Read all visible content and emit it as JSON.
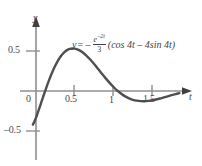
{
  "figure": {
    "background_color": "#ffffff",
    "curve_color": "#4f4f4f",
    "axis_color": "#8c8c8c",
    "text_color": "#4a4a4a"
  },
  "axes": {
    "y_axis_label": "y",
    "x_axis_label": "t",
    "x_tick_labels": [
      "0",
      "0.5",
      "1",
      "1.5"
    ],
    "y_tick_labels": [
      "0.5",
      "–0.5"
    ],
    "origin_label": "0"
  },
  "equation": {
    "lhs": "y",
    "equals": "= –",
    "numerator": "e",
    "numerator_exponent": "–2t",
    "denominator": "3",
    "tail": "(cos 4t – 4sin 4t)",
    "plain": "y = – e^(–2t)/3 (cos 4t – 4sin 4t)"
  },
  "chart_data": {
    "type": "line",
    "title": "",
    "xlabel": "t",
    "ylabel": "y",
    "xlim": [
      -0.05,
      1.88
    ],
    "ylim": [
      -0.62,
      0.82
    ],
    "xticks": [
      0,
      0.5,
      1,
      1.5
    ],
    "xticklabels": [
      "0",
      "0.5",
      "1",
      "1.5"
    ],
    "yticks": [
      -0.5,
      0.5
    ],
    "yticklabels": [
      "–0.5",
      "0.5"
    ],
    "grid": false,
    "legend": null,
    "annotations": [
      {
        "text": "y = – e^(–2t)/3 (cos 4t – 4sin 4t)",
        "x": 0.5,
        "y": 0.55
      }
    ],
    "series": [
      {
        "name": "y(t) = -(e^(-2t)/3)(cos 4t - 4 sin 4t)",
        "color": "#4f4f4f",
        "x": [
          -0.04,
          -0.02,
          0.0,
          0.02,
          0.04,
          0.06,
          0.08,
          0.1,
          0.13,
          0.16,
          0.2,
          0.24,
          0.28,
          0.32,
          0.36,
          0.4,
          0.45,
          0.5,
          0.55,
          0.6,
          0.65,
          0.7,
          0.75,
          0.8,
          0.85,
          0.9,
          0.95,
          1.0,
          1.05,
          1.1,
          1.15,
          1.2,
          1.25,
          1.3,
          1.35,
          1.4,
          1.45,
          1.5,
          1.55,
          1.6,
          1.65,
          1.7,
          1.75,
          1.8,
          1.85
        ],
        "y": [
          -0.42,
          -0.38,
          -0.333,
          -0.28,
          -0.224,
          -0.166,
          -0.108,
          -0.05,
          0.034,
          0.114,
          0.213,
          0.3,
          0.374,
          0.434,
          0.48,
          0.511,
          0.53,
          0.53,
          0.514,
          0.484,
          0.443,
          0.393,
          0.337,
          0.277,
          0.217,
          0.158,
          0.102,
          0.05,
          0.004,
          -0.035,
          -0.067,
          -0.092,
          -0.11,
          -0.121,
          -0.127,
          -0.128,
          -0.124,
          -0.116,
          -0.106,
          -0.094,
          -0.08,
          -0.066,
          -0.052,
          -0.039,
          -0.027
        ],
        "peak": {
          "t": 0.36,
          "y": 0.62
        },
        "trough": {
          "t": 1.08,
          "y": -0.12
        },
        "zero_crossings": [
          0.1,
          1.03
        ]
      }
    ]
  }
}
